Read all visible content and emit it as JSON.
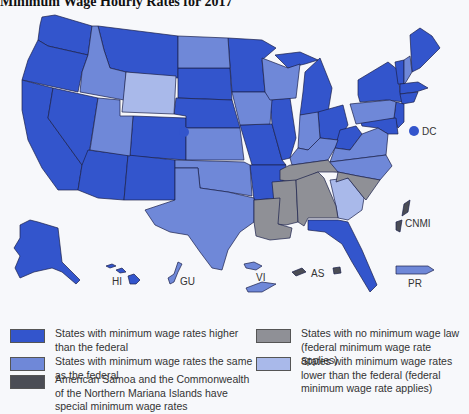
{
  "title": "Minimum Wage Hourly Rates for 2017",
  "colors": {
    "higher": "#3355cc",
    "same": "#6f88d8",
    "none": "#8f9096",
    "lower": "#a9b9ea",
    "special": "#4b4d55",
    "background": "#f7f8fb",
    "border": "#1a1f4a"
  },
  "map": {
    "territory_labels": {
      "dc": "DC",
      "cnmi": "CNMI",
      "hi": "HI",
      "gu": "GU",
      "vi": "VI",
      "as": "AS",
      "pr": "PR"
    },
    "states": {
      "higher": [
        "WA",
        "OR",
        "CA",
        "NV",
        "AZ",
        "MT",
        "CO",
        "NM",
        "SD",
        "NE",
        "MN",
        "MO",
        "AR",
        "IL",
        "MI",
        "OH",
        "WV",
        "FL",
        "ME",
        "VT",
        "NY",
        "MA",
        "RI",
        "CT",
        "NJ",
        "DE",
        "MD",
        "AK",
        "HI",
        "DC"
      ],
      "same": [
        "ID",
        "UT",
        "ND",
        "KS",
        "OK",
        "TX",
        "IA",
        "WI",
        "IN",
        "KY",
        "VA",
        "NC",
        "PA",
        "NH",
        "GU",
        "VI",
        "PR"
      ],
      "lower": [
        "WY",
        "GA"
      ],
      "none": [
        "TN",
        "MS",
        "AL",
        "LA",
        "SC"
      ],
      "special": [
        "AS",
        "CNMI"
      ]
    }
  },
  "legend": [
    {
      "key": "higher",
      "label": "States with minimum wage rates higher than the federal"
    },
    {
      "key": "same",
      "label": "States with minimum wage rates the same as the federal"
    },
    {
      "key": "special",
      "label": "American Samoa and the Commonwealth of the Northern Mariana Islands have special minimum wage rates"
    },
    {
      "key": "none",
      "label": "States with no minimum wage law (federal minimum wage rate applies)"
    },
    {
      "key": "lower",
      "label": "States with minimum wage rates lower than the federal (federal minimum wage rate applies)"
    }
  ]
}
